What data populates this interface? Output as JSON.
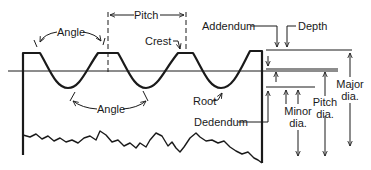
{
  "diagram": {
    "labels": {
      "pitch": "Pitch",
      "angle_top": "Angle",
      "angle_bottom": "Angle",
      "crest": "Crest",
      "addendum": "Addendum",
      "depth": "Depth",
      "root": "Root",
      "dedendum": "Dedendum",
      "minor_dia_1": "Minor",
      "minor_dia_2": "dia.",
      "pitch_dia_1": "Pitch",
      "pitch_dia_2": "dia.",
      "major_dia_1": "Major",
      "major_dia_2": "dia."
    },
    "colors": {
      "stroke": "#1a1a1a",
      "background": "#ffffff"
    }
  }
}
